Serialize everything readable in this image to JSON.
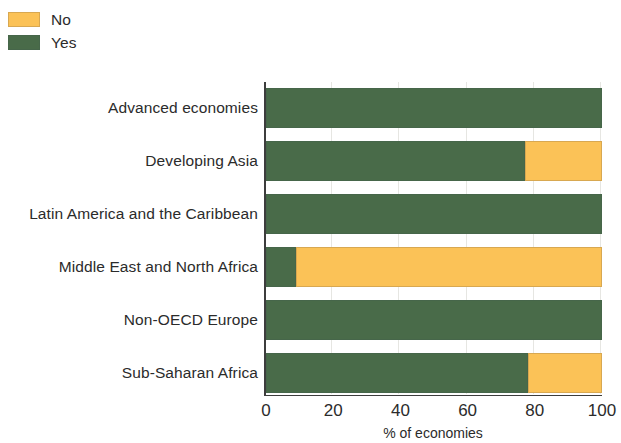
{
  "legend": {
    "items": [
      {
        "label": "No",
        "color": "#fbc257",
        "icon": "legend-swatch-no"
      },
      {
        "label": "Yes",
        "color": "#496b49",
        "icon": "legend-swatch-yes"
      }
    ]
  },
  "axis": {
    "x_title": "% of economies",
    "x_ticks": [
      "0",
      "20",
      "40",
      "60",
      "80",
      "100"
    ]
  },
  "chart_data": {
    "type": "bar",
    "orientation": "horizontal",
    "stacked": true,
    "stacked_normalized": true,
    "title": "",
    "subtitle": "",
    "xlabel": "% of economies",
    "ylabel": "",
    "xlim": [
      0,
      100
    ],
    "xticks": [
      0,
      20,
      40,
      60,
      80,
      100
    ],
    "grid": true,
    "grid_axis": "x",
    "legend_position": "top-left",
    "categories": [
      "Advanced economies",
      "Developing Asia",
      "Latin America and the Caribbean",
      "Middle East and North Africa",
      "Non-OECD Europe",
      "Sub-Saharan Africa"
    ],
    "series": [
      {
        "name": "Yes",
        "color": "#496b49",
        "values": [
          100,
          77,
          100,
          9,
          100,
          78
        ]
      },
      {
        "name": "No",
        "color": "#fbc257",
        "values": [
          0,
          23,
          0,
          91,
          0,
          22
        ]
      }
    ]
  }
}
